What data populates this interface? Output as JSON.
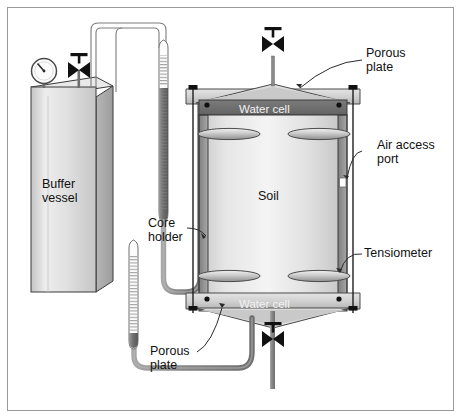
{
  "diagram": {
    "background_color": "#ffffff",
    "border_color": "#9a9a9a"
  },
  "labels": {
    "buffer_vessel": "Buffer\nvessel",
    "porous_plate_top": "Porous\nplate",
    "porous_plate_bottom": "Porous\nplate",
    "air_access_port": "Air access\nport",
    "tensiometer": "Tensiometer",
    "core_holder": "Core\nholder",
    "soil": "Soil",
    "water_cell_top": "Water cell",
    "water_cell_bottom": "Water cell"
  },
  "components": {
    "pressure_gauge": "pressure-gauge-icon",
    "valve_buffer": "valve-icon",
    "valve_top": "valve-icon",
    "valve_bottom": "valve-icon",
    "tensiometer_upper": "graduated-manometer-tube",
    "tensiometer_lower": "graduated-manometer-tube",
    "probe_count": 4,
    "tie_rod_count": 2
  },
  "colors": {
    "soil_fill_light": "#f0f0f0",
    "soil_fill_mid": "#d8d8d8",
    "cell_band": "#6e6e6e",
    "flange": "#d5d5d5",
    "tube": "#8d8d8d",
    "metal_dark": "#5a5a5a",
    "outline": "#2b2b2b",
    "vessel_light": "#ededed",
    "vessel_dark": "#bdbdbd",
    "fluid": "#7a7a7a"
  }
}
